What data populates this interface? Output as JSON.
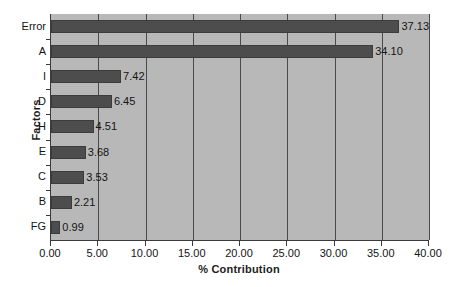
{
  "chart_data": {
    "type": "bar",
    "orientation": "horizontal",
    "title": "",
    "xlabel": "% Contribution",
    "ylabel": "Factors",
    "categories": [
      "Error",
      "A",
      "I",
      "D",
      "H",
      "E",
      "C",
      "B",
      "FG"
    ],
    "values": [
      37.13,
      34.1,
      7.42,
      6.45,
      4.51,
      3.68,
      3.53,
      2.21,
      0.99
    ],
    "value_labels": [
      "37.13",
      "34.10",
      "7.42",
      "6.45",
      "4.51",
      "3.68",
      "3.53",
      "2.21",
      "0.99"
    ],
    "xlim": [
      0.0,
      40.0
    ],
    "xticks": [
      0,
      5,
      10,
      15,
      20,
      25,
      30,
      35,
      40
    ],
    "xtick_labels": [
      "0.00",
      "5.00",
      "10.00",
      "15.00",
      "20.00",
      "25.00",
      "30.00",
      "35.00",
      "40.00"
    ],
    "grid": true,
    "grid_axis": "x",
    "legend": false,
    "colors": {
      "bar_fill": "#4d4d4d",
      "bar_border": "#3c3c3c",
      "plot_background": "#b8b8b8",
      "page_background": "#ffffff",
      "gridline": "#4a4a4a",
      "axis_line": "#3a3a3a",
      "text": "#141414"
    }
  }
}
